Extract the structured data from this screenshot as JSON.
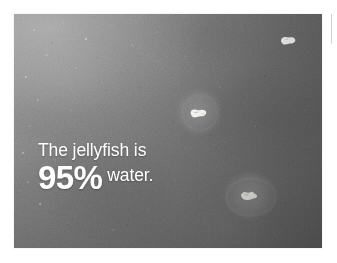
{
  "image": {
    "kind": "underwater-photograph",
    "subject": "jellyfish",
    "alt": "Grainy grayscale underwater photograph of dark ocean water with three small pale jellyfish drifting, overlaid with a white caption.",
    "frame": {
      "x": 14,
      "y": 14,
      "width": 308,
      "height": 234
    },
    "palette": {
      "page_background": "#ffffff",
      "water_light": "#8a8a8a",
      "water_mid": "#6e6e6e",
      "water_dark": "#5c5c5c",
      "caption_text": "#ffffff",
      "rule": "#d2d2d2"
    }
  },
  "caption": {
    "line1": "The jellyfish is",
    "percent": "95%",
    "line2_tail": "water.",
    "full_text": "The jellyfish is 95% water."
  },
  "subjects": [
    {
      "name": "jellyfish-top-right",
      "x": 273,
      "y": 28,
      "width": 30,
      "height": 26,
      "bell_width": 17,
      "bell_height": 9,
      "brightness": "bright",
      "has_halo": false
    },
    {
      "name": "jellyfish-center",
      "x": 176,
      "y": 89,
      "width": 44,
      "height": 44,
      "bell_width": 19,
      "bell_height": 10,
      "brightness": "bright",
      "has_halo": true
    },
    {
      "name": "jellyfish-lower-right",
      "x": 222,
      "y": 172,
      "width": 54,
      "height": 44,
      "bell_width": 19,
      "bell_height": 10,
      "brightness": "medium",
      "has_halo": true
    }
  ]
}
